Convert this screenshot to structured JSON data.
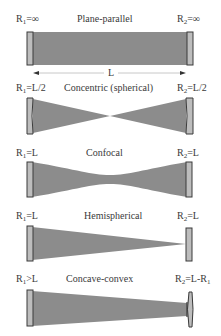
{
  "figure": {
    "colors": {
      "beam": "#8c8c8c",
      "mirror_fill": "#bdbdbd",
      "mirror_edge": "#3a3a3a",
      "text": "#3a3a3a"
    },
    "length_label": "L",
    "resonators": [
      {
        "name": "Plane-parallel",
        "r1": {
          "sym": "R",
          "sub": "1",
          "rel": "=∞"
        },
        "r2": {
          "sym": "R",
          "sub": "2",
          "rel": "=∞"
        }
      },
      {
        "name": "Concentric (spherical)",
        "r1": {
          "sym": "R",
          "sub": "1",
          "rel": "=L/2"
        },
        "r2": {
          "sym": "R",
          "sub": "2",
          "rel": "=L/2"
        }
      },
      {
        "name": "Confocal",
        "r1": {
          "sym": "R",
          "sub": "1",
          "rel": "=L"
        },
        "r2": {
          "sym": "R",
          "sub": "2",
          "rel": "=L"
        }
      },
      {
        "name": "Hemispherical",
        "r1": {
          "sym": "R",
          "sub": "1",
          "rel": "=L"
        },
        "r2": {
          "sym": "R",
          "sub": "2",
          "rel": "=L"
        }
      },
      {
        "name": "Concave-convex",
        "r1": {
          "sym": "R",
          "sub": "1",
          "rel": ">L"
        },
        "r2": {
          "sym": "R",
          "sub": "2",
          "rel": "=L-R",
          "rel_sub": "1"
        }
      }
    ]
  }
}
